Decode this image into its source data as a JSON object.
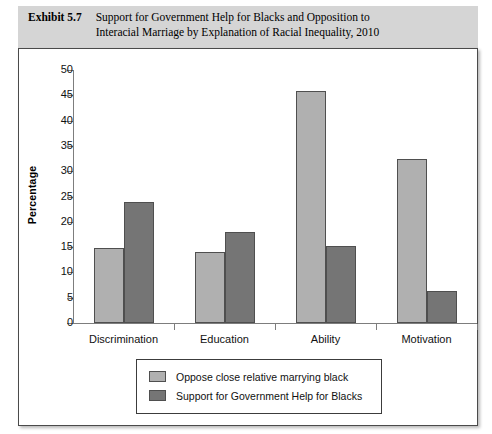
{
  "exhibit": {
    "label": "Exhibit 5.7",
    "title_line1": "Support for Government Help for Blacks and Opposition to",
    "title_line2": "Interacial Marriage by Explanation of Racial Inequality, 2010"
  },
  "colors": {
    "band_background": "#d5d5d5",
    "series_light": "#b0b0b0",
    "series_dark": "#757575",
    "bar_outline": "#4f4f4f",
    "axis": "#7d7d7d",
    "frame_border": "#4a4a4a"
  },
  "chart_data": {
    "type": "bar",
    "title": "Support for Government Help for Blacks and Opposition to Interacial Marriage by Explanation of Racial Inequality, 2010",
    "xlabel": "",
    "ylabel": "Percentage",
    "ylim": [
      0,
      50
    ],
    "yticks": [
      0,
      5,
      10,
      15,
      20,
      25,
      30,
      35,
      40,
      45,
      50
    ],
    "grid": false,
    "legend_position": "bottom-center",
    "categories": [
      "Discrimination",
      "Education",
      "Ability",
      "Motivation"
    ],
    "series": [
      {
        "name": "Oppose close relative marrying black",
        "color": "#b0b0b0",
        "values": [
          14.8,
          14.1,
          45.8,
          32.4
        ]
      },
      {
        "name": "Support for Government Help for Blacks",
        "color": "#757575",
        "values": [
          24.0,
          17.9,
          15.3,
          6.3
        ]
      }
    ]
  }
}
